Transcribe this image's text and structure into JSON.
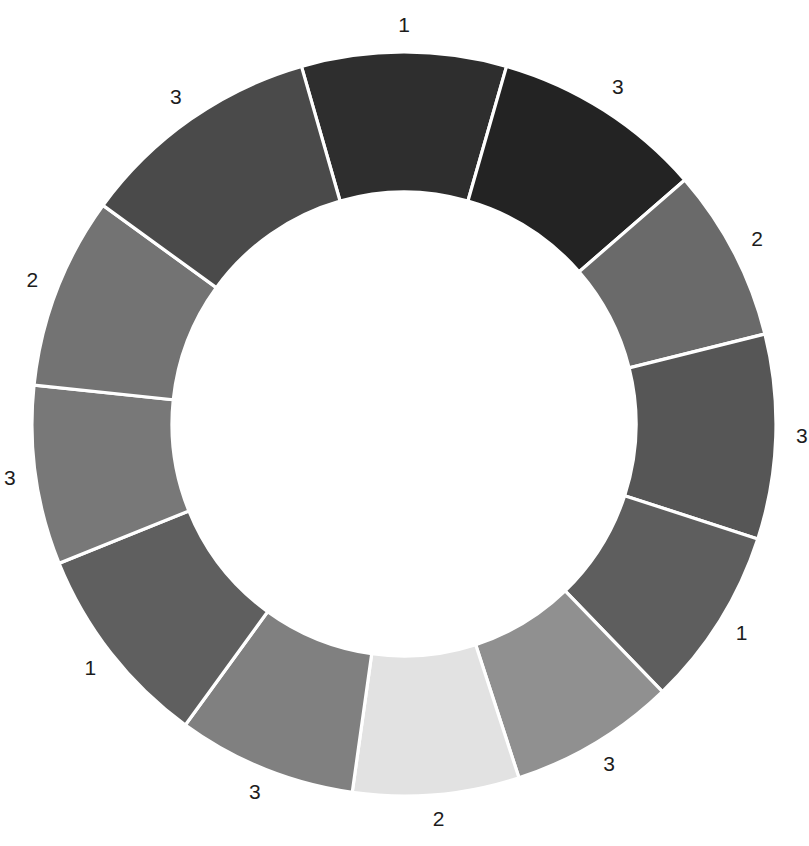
{
  "chart_data": {
    "type": "pie",
    "variant": "donut",
    "title": "",
    "subtitle": "",
    "xlabel": "",
    "ylabel": "",
    "legend": false,
    "legend_position": "none",
    "grid": false,
    "background": "#ffffff",
    "separator_color": "#ffffff",
    "separator_width": 3.2,
    "center": {
      "cx": 404,
      "cy": 424
    },
    "radius": {
      "outer": 372,
      "inner": 232
    },
    "label_radius": 398,
    "start_angle_deg": -16,
    "direction": "clockwise",
    "total_degrees": 360,
    "categories": [
      "1",
      "3",
      "2",
      "3",
      "1",
      "3",
      "2",
      "3",
      "1",
      "3",
      "2",
      "3"
    ],
    "values": [
      32,
      33,
      27,
      32,
      28,
      26,
      26,
      28,
      32,
      28,
      30,
      38
    ],
    "colors": [
      "#2e2e2e",
      "#232323",
      "#6a6a6a",
      "#565656",
      "#5e5e5e",
      "#909090",
      "#e2e2e2",
      "#808080",
      "#5f5f5f",
      "#787878",
      "#737373",
      "#4a4a4a"
    ],
    "segments": [
      {
        "index": 0,
        "label": "1",
        "color": "#2e2e2e",
        "sweep_deg": 32,
        "position": "top"
      },
      {
        "index": 1,
        "label": "3",
        "color": "#232323",
        "sweep_deg": 33,
        "position": "top-right"
      },
      {
        "index": 2,
        "label": "2",
        "color": "#6a6a6a",
        "sweep_deg": 27,
        "position": "right-upper"
      },
      {
        "index": 3,
        "label": "3",
        "color": "#565656",
        "sweep_deg": 32,
        "position": "right"
      },
      {
        "index": 4,
        "label": "1",
        "color": "#5e5e5e",
        "sweep_deg": 28,
        "position": "right-lower"
      },
      {
        "index": 5,
        "label": "3",
        "color": "#909090",
        "sweep_deg": 26,
        "position": "bottom-right"
      },
      {
        "index": 6,
        "label": "2",
        "color": "#e2e2e2",
        "sweep_deg": 26,
        "position": "bottom"
      },
      {
        "index": 7,
        "label": "3",
        "color": "#808080",
        "sweep_deg": 28,
        "position": "bottom-left"
      },
      {
        "index": 8,
        "label": "1",
        "color": "#5f5f5f",
        "sweep_deg": 32,
        "position": "left-lower"
      },
      {
        "index": 9,
        "label": "3",
        "color": "#787878",
        "sweep_deg": 28,
        "position": "left"
      },
      {
        "index": 10,
        "label": "2",
        "color": "#737373",
        "sweep_deg": 30,
        "position": "left-upper"
      },
      {
        "index": 11,
        "label": "3",
        "color": "#4a4a4a",
        "sweep_deg": 38,
        "position": "top-left"
      }
    ],
    "label_text_color": "#1c1c1c",
    "label_font_size": 21
  }
}
